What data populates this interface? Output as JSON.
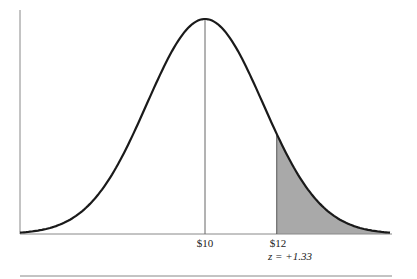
{
  "chart_data": {
    "type": "area",
    "title": "",
    "mean": 10,
    "x_labels": [
      "$10",
      "$12"
    ],
    "mean_label": "$10",
    "cutoff_label": "$12",
    "z_label": "z = +1.33",
    "z_value": 1.33,
    "shaded_region": "x > $12 (right tail)",
    "xlabel": "",
    "ylabel": "",
    "grid": false,
    "colors": {
      "curve": "#1a1a1a",
      "shade": "#a9a9a9",
      "axis": "#888888"
    }
  }
}
